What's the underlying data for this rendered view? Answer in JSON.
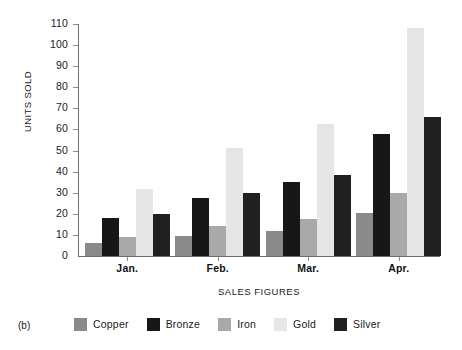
{
  "figure": {
    "caption": "(b)"
  },
  "chart_data": {
    "type": "bar",
    "title": "",
    "xlabel": "SALES FIGURES",
    "ylabel": "UNITS SOLD",
    "categories": [
      "Jan.",
      "Feb.",
      "Mar.",
      "Apr."
    ],
    "ylim": [
      0,
      110
    ],
    "yticks": [
      0,
      10,
      20,
      30,
      40,
      50,
      60,
      70,
      80,
      90,
      100,
      110
    ],
    "grid": false,
    "legend_position": "bottom",
    "series": [
      {
        "name": "Copper",
        "color": "#8a8a8a",
        "values": [
          6,
          9.5,
          12,
          20.5
        ]
      },
      {
        "name": "Bronze",
        "color": "#171717",
        "values": [
          18,
          27.5,
          35,
          58
        ]
      },
      {
        "name": "Iron",
        "color": "#a9a9a9",
        "values": [
          9,
          14,
          17.5,
          30
        ]
      },
      {
        "name": "Gold",
        "color": "#e6e6e6",
        "values": [
          32,
          51,
          62.5,
          108
        ]
      },
      {
        "name": "Silver",
        "color": "#202020",
        "values": [
          20,
          30,
          38.5,
          66
        ]
      }
    ]
  }
}
